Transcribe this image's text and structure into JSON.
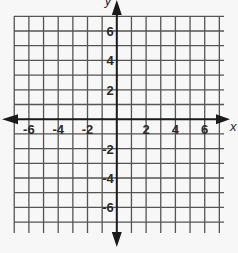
{
  "chart_data": {
    "type": "coordinate-plane",
    "title": "",
    "xlabel": "x",
    "ylabel": "y",
    "xlim": [
      -7,
      7
    ],
    "ylim": [
      -7,
      7
    ],
    "grid": true,
    "grid_step": 1,
    "x_tick_labels": [
      "-6",
      "-4",
      "-2",
      "2",
      "4",
      "6"
    ],
    "x_tick_values": [
      -6,
      -4,
      -2,
      2,
      4,
      6
    ],
    "y_tick_labels": [
      "6",
      "4",
      "2",
      "-2",
      "-4",
      "-6"
    ],
    "y_tick_values": [
      6,
      4,
      2,
      -2,
      -4,
      -6
    ],
    "axes_arrows": true,
    "data_points": []
  },
  "colors": {
    "background": "#f7f7f7",
    "grid": "#555555",
    "axis": "#1a1a1a",
    "text": "#2a2a2a"
  }
}
